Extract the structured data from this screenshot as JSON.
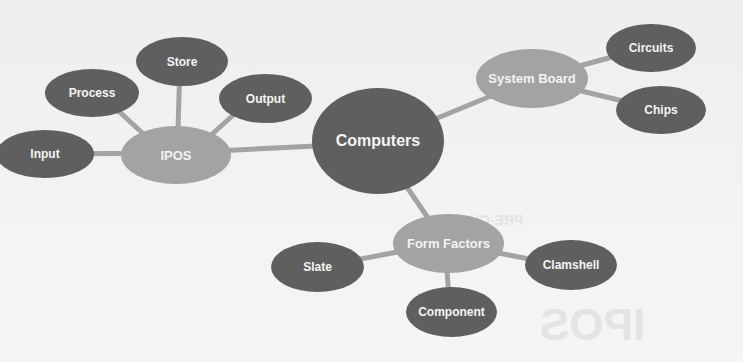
{
  "diagram": {
    "type": "concept-map",
    "colors": {
      "center": "#5f5f5f",
      "branch": "#a3a3a3",
      "leaf": "#5f5f5f",
      "line": "#a3a3a3",
      "text": "#f4f4f4",
      "background": "#f1f1ef"
    },
    "center": {
      "label": "Computers"
    },
    "branches": [
      {
        "label": "IPOS",
        "children": [
          {
            "label": "Input"
          },
          {
            "label": "Process"
          },
          {
            "label": "Store"
          },
          {
            "label": "Output"
          }
        ]
      },
      {
        "label": "System Board",
        "children": [
          {
            "label": "Circuits"
          },
          {
            "label": "Chips"
          }
        ]
      },
      {
        "label": "Form Factors",
        "children": [
          {
            "label": "Slate"
          },
          {
            "label": "Component"
          },
          {
            "label": "Clamshell"
          }
        ]
      }
    ]
  },
  "background_ghost": {
    "heading": "PRE-CHECK",
    "word": "IPOS"
  }
}
